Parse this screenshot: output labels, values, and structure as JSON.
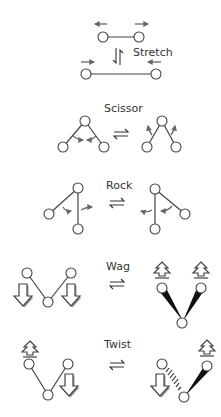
{
  "diagram": {
    "colors": {
      "background": "#ffffff",
      "atom_stroke": "#444444",
      "bond": "#444444",
      "motion_arrow": "#666666",
      "wedge": "#111111",
      "label": "#333333"
    },
    "modes": [
      {
        "id": "stretch",
        "label": "Stretch",
        "description": "Symmetric bond stretching: atoms move apart then together"
      },
      {
        "id": "scissor",
        "label": "Scissor",
        "description": "In-plane bending: bond angle closes and opens"
      },
      {
        "id": "rock",
        "label": "Rock",
        "description": "In-plane rocking: both bonds swing the same direction"
      },
      {
        "id": "wag",
        "label": "Wag",
        "description": "Out-of-plane wagging: both atoms move below then above plane"
      },
      {
        "id": "twist",
        "label": "Twist",
        "description": "Out-of-plane twisting: atoms move in opposite directions"
      }
    ],
    "equilibrium_symbol": "⇌"
  }
}
